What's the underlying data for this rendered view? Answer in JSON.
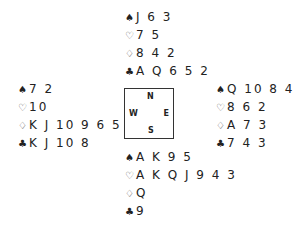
{
  "hands": {
    "north": {
      "spades": "J 6 3",
      "hearts": "7 5",
      "diamonds": "8 4 2",
      "clubs": "A Q 6 5 2"
    },
    "west": {
      "spades": "7 2",
      "hearts": "10",
      "diamonds": "K J 10 9 6 5",
      "clubs": "K J 10 8"
    },
    "east": {
      "spades": "Q 10 8 4",
      "hearts": "8 6 2",
      "diamonds": "A 7 3",
      "clubs": "7 4 3"
    },
    "south": {
      "spades": "A K 9 5",
      "hearts": "A K Q J 9 4 3",
      "diamonds": "Q",
      "clubs": "9"
    }
  },
  "suit_symbols": {
    "spades": "♠",
    "hearts": "♡",
    "diamonds": "♢",
    "clubs": "♣"
  },
  "compass": {
    "north": "N",
    "west": "W",
    "east": "E",
    "south": "S"
  }
}
